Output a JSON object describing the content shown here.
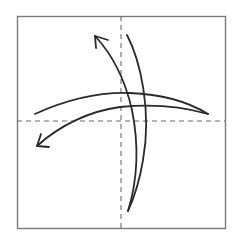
{
  "diagram": {
    "type": "origami-fold-diagram",
    "colors": {
      "background": "#ffffff",
      "paper_border": "#7a7a7a",
      "dashed_line": "#6a6a6a",
      "arrow": "#2a2a2a"
    },
    "square": {
      "x": 17,
      "y": 16,
      "width": 208,
      "height": 212
    },
    "fold_lines": [
      {
        "name": "vertical-center-fold",
        "style": "dashed",
        "x1": 121,
        "y1": 16,
        "x2": 121,
        "y2": 228
      },
      {
        "name": "horizontal-center-fold",
        "style": "dashed",
        "x1": 17,
        "y1": 121,
        "x2": 225,
        "y2": 121
      }
    ],
    "arrows": [
      {
        "name": "vertical-fold-arrow",
        "direction": "up-left",
        "from": [
          127,
          35
        ],
        "to": [
          95,
          36
        ],
        "bottom": [
          128,
          211
        ]
      },
      {
        "name": "horizontal-fold-arrow",
        "direction": "down-left",
        "from": [
          35,
          114
        ],
        "to": [
          37,
          146
        ],
        "right": [
          208,
          114
        ]
      }
    ]
  }
}
